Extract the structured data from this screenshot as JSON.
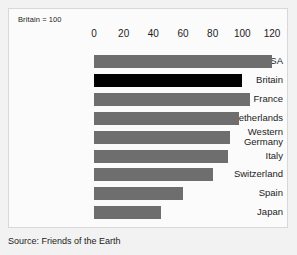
{
  "note": "Britain = 100",
  "source": "Source: Friends of the Earth",
  "chart_data": {
    "type": "bar",
    "orientation": "horizontal",
    "title": "Britain = 100",
    "xlabel": "",
    "ylabel": "",
    "xlim": [
      0,
      120
    ],
    "grid": false,
    "legend": "none",
    "tick_labels": [
      "0",
      "20",
      "40",
      "60",
      "80",
      "100",
      "120"
    ],
    "ticks": [
      0,
      20,
      40,
      60,
      80,
      100,
      120
    ],
    "categories": [
      "USA",
      "Britain",
      "France",
      "The Netherlands",
      "Western\nGermany",
      "Italy",
      "Switzerland",
      "Spain",
      "Japan"
    ],
    "values": [
      120,
      100,
      105,
      98,
      92,
      90,
      80,
      60,
      45
    ],
    "highlight_category": "Britain",
    "colors": {
      "bar": "#6e6e6e",
      "highlight_bar": "#000000",
      "text": "#1b1b1b",
      "card_background": "#fbfbfb",
      "card_border": "#d8d8d8",
      "page_background": "#f2f2f2"
    }
  }
}
